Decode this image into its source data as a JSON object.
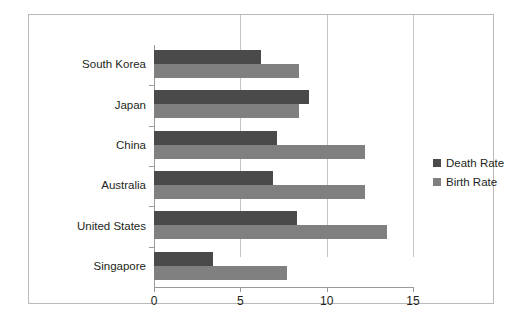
{
  "chart_data": {
    "type": "bar",
    "orientation": "horizontal",
    "title": "",
    "subtitle": "",
    "xlabel": "",
    "ylabel": "",
    "xlim": [
      0,
      15
    ],
    "xticks": [
      0,
      5,
      10,
      15
    ],
    "xtick_labels": [
      "0",
      "5",
      "10",
      "15"
    ],
    "grid": true,
    "grid_axis": "x",
    "legend_position": "right",
    "categories": [
      "South Korea",
      "Japan",
      "China",
      "Australia",
      "United States",
      "Singapore"
    ],
    "series": [
      {
        "name": "Death Rate",
        "color": "#4a4a4a",
        "values": [
          6.2,
          9.0,
          7.1,
          6.9,
          8.3,
          3.4
        ]
      },
      {
        "name": "Birth Rate",
        "color": "#808080",
        "values": [
          8.4,
          8.4,
          12.2,
          12.2,
          13.5,
          7.7
        ]
      }
    ]
  },
  "legend": {
    "items": [
      {
        "label": "Death Rate",
        "color": "#4a4a4a"
      },
      {
        "label": "Birth Rate",
        "color": "#808080"
      }
    ]
  }
}
